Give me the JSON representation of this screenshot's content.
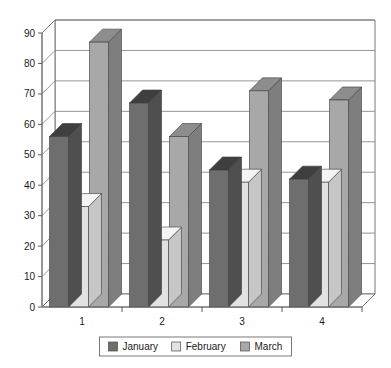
{
  "chart_data": {
    "type": "bar",
    "title": "",
    "subtitle": "",
    "xlabel": "",
    "ylabel": "",
    "categories": [
      "1",
      "2",
      "3",
      "4"
    ],
    "series": [
      {
        "name": "January",
        "color": "#6e6e6e",
        "values": [
          56,
          67,
          45,
          42
        ]
      },
      {
        "name": "February",
        "color": "#e2e2e2",
        "values": [
          33,
          22,
          41,
          41
        ]
      },
      {
        "name": "March",
        "color": "#a8a8a8",
        "values": [
          87,
          56,
          71,
          68
        ]
      }
    ],
    "ylim": [
      0,
      90
    ],
    "yticks": [
      0,
      10,
      20,
      30,
      40,
      50,
      60,
      70,
      80,
      90
    ],
    "ytick_labels": [
      "0",
      "10",
      "20",
      "30",
      "40",
      "50",
      "60",
      "70",
      "80",
      "90"
    ],
    "grid": true,
    "legend_position": "bottom",
    "three_d": true
  },
  "legend": {
    "items": [
      {
        "label": "January",
        "swatch_name": "legend-swatch-january"
      },
      {
        "label": "February",
        "swatch_name": "legend-swatch-february"
      },
      {
        "label": "March",
        "swatch_name": "legend-swatch-march"
      }
    ]
  },
  "colors": {
    "january_front": "#6e6e6e",
    "january_top": "#3f3f3f",
    "january_side": "#4f4f4f",
    "february_front": "#e2e2e2",
    "february_top": "#f4f4f4",
    "february_side": "#c6c6c6",
    "march_front": "#a8a8a8",
    "march_top": "#8d8d8d",
    "march_side": "#7e7e7e",
    "grid": "#7a7a7a",
    "frame": "#6a6a6a",
    "text": "#1a1a1a",
    "background": "#ffffff"
  }
}
